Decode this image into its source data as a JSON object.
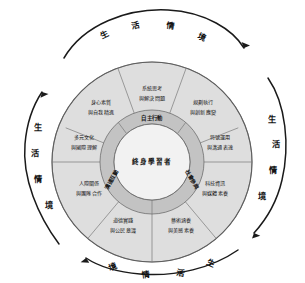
{
  "diagram": {
    "core": {
      "label": "終身學習者"
    },
    "rings": [
      {
        "id": "autonomy",
        "label": "自主行動"
      },
      {
        "id": "communication",
        "label": "溝通互動"
      },
      {
        "id": "social",
        "label": "社會參與"
      }
    ],
    "sectors": [
      {
        "id": "a1",
        "line1": "身心素質",
        "line2": "與自我精進",
        "dimension": "自主行動"
      },
      {
        "id": "a2",
        "line1": "系統思考",
        "line2": "與解決問題",
        "dimension": "自主行動"
      },
      {
        "id": "a3",
        "line1": "規劃執行",
        "line2": "與創新應變",
        "dimension": "自主行動"
      },
      {
        "id": "b1",
        "line1": "符號運用",
        "line2": "與溝通表達",
        "dimension": "溝通互動"
      },
      {
        "id": "b2",
        "line1": "科技資訊",
        "line2": "與媒體素養",
        "dimension": "溝通互動"
      },
      {
        "id": "b3",
        "line1": "藝術涵養",
        "line2": "與美感素養",
        "dimension": "溝通互動"
      },
      {
        "id": "c1",
        "line1": "道德實踐",
        "line2": "與公民意識",
        "dimension": "社會參與"
      },
      {
        "id": "c2",
        "line1": "人際關係",
        "line2": "與團隊合作",
        "dimension": "社會參與"
      },
      {
        "id": "c3",
        "line1": "多元文化",
        "line2": "與國際理解",
        "dimension": "社會參與"
      }
    ],
    "context_arrows": [
      {
        "id": "top",
        "chars": [
          "生",
          "活",
          "情",
          "境"
        ]
      },
      {
        "id": "right",
        "chars": [
          "生",
          "活",
          "情",
          "境"
        ]
      },
      {
        "id": "bottom",
        "chars": [
          "生",
          "活",
          "情",
          "境"
        ]
      },
      {
        "id": "left",
        "chars": [
          "生",
          "活",
          "情",
          "境"
        ]
      }
    ],
    "colors": {
      "outer_ring_fill": "#dedede",
      "middle_ring_fill": "#c3c3c3",
      "core_fill": "#f2f2f2",
      "stroke": "#6f6f6f",
      "arrow": "#1a1a1a",
      "text": "#141414",
      "background": "#ffffff"
    }
  }
}
